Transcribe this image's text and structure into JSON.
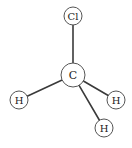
{
  "diagram": {
    "colors": {
      "bond": "#3a3a3a",
      "atom_outline": "#555555",
      "atom_fill": "#ffffff",
      "label": "#222222",
      "background": "#ffffff"
    },
    "atoms": [
      {
        "id": "cl",
        "label": "Cl",
        "x": 73,
        "y": 16,
        "r": 9,
        "font_size": 10
      },
      {
        "id": "c",
        "label": "C",
        "x": 73,
        "y": 75,
        "r": 12,
        "font_size": 11
      },
      {
        "id": "h_left",
        "label": "H",
        "x": 19,
        "y": 100,
        "r": 9,
        "font_size": 10
      },
      {
        "id": "h_right",
        "label": "H",
        "x": 116,
        "y": 100,
        "r": 9,
        "font_size": 10
      },
      {
        "id": "h_bottom",
        "label": "H",
        "x": 104,
        "y": 128,
        "r": 9,
        "font_size": 10
      }
    ],
    "bonds": [
      {
        "from": "c",
        "to": "cl"
      },
      {
        "from": "c",
        "to": "h_left"
      },
      {
        "from": "c",
        "to": "h_right"
      },
      {
        "from": "c",
        "to": "h_bottom"
      }
    ]
  }
}
